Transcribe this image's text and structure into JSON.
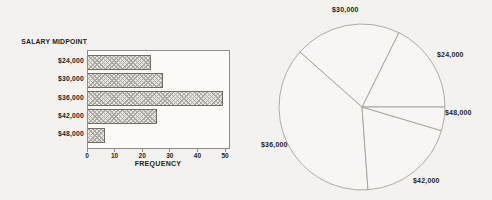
{
  "figure": {
    "background": "#f3f2ef",
    "text_color": "#1f1f1f",
    "line_color": "#8f8d89"
  },
  "bar_chart": {
    "title": "SALARY MIDPOINT",
    "xlabel": "FREQUENCY",
    "categories": [
      "$24,000",
      "$30,000",
      "$36,000",
      "$42,000",
      "$48,000"
    ],
    "values": [
      23,
      27,
      49,
      25,
      6
    ],
    "x_ticks": [
      0,
      10,
      20,
      30,
      40,
      50
    ],
    "x_max": 50
  },
  "pie_chart": {
    "labels": [
      "$24,000",
      "$30,000",
      "$36,000",
      "$42,000",
      "$48,000"
    ],
    "values": [
      23,
      27,
      49,
      25,
      6
    ],
    "start_angle_deg": 0,
    "direction": "counterclockwise"
  },
  "chart_data": [
    {
      "type": "bar",
      "orientation": "horizontal",
      "title": "SALARY MIDPOINT",
      "categories": [
        "$24,000",
        "$30,000",
        "$36,000",
        "$42,000",
        "$48,000"
      ],
      "values": [
        23,
        27,
        49,
        25,
        6
      ],
      "xlabel": "FREQUENCY",
      "ylabel": "SALARY MIDPOINT",
      "xlim": [
        0,
        50
      ],
      "x_ticks": [
        0,
        10,
        20,
        30,
        40,
        50
      ],
      "grid": false,
      "legend": false,
      "bar_style": "gray crosshatch pattern, thin dark border"
    },
    {
      "type": "pie",
      "labels": [
        "$24,000",
        "$30,000",
        "$36,000",
        "$42,000",
        "$48,000"
      ],
      "values": [
        23,
        27,
        49,
        25,
        6
      ],
      "start_angle": 0,
      "counterclockwise": true,
      "slice_fill": "unfilled (paper white) with thin gray outlines",
      "legend": false
    }
  ]
}
